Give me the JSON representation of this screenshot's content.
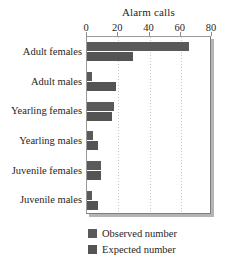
{
  "chart_data": {
    "type": "bar",
    "title": "Alarm calls",
    "xlabel": "Alarm calls",
    "ylabel": "",
    "orientation": "horizontal",
    "xlim": [
      0,
      80
    ],
    "xticks": [
      0,
      20,
      40,
      60,
      80
    ],
    "xtick_labels": [
      "0",
      "20",
      "40",
      "60",
      "80"
    ],
    "grid": "vertical-dotted",
    "axis_position": "top",
    "legend_position": "below-plot",
    "categories": [
      "Adult females",
      "Adult males",
      "Yearling females",
      "Yearling males",
      "Juvenile females",
      "Juvenile males"
    ],
    "series": [
      {
        "name": "Observed number",
        "color": "#5a5a5a",
        "values": [
          65,
          3,
          17,
          4,
          9,
          3
        ]
      },
      {
        "name": "Expected number",
        "color": "#545454",
        "values": [
          29.5,
          18.5,
          16,
          7,
          9,
          7
        ]
      }
    ]
  },
  "legend": {
    "items": [
      {
        "label": "Observed number",
        "color": "#5a5a5a"
      },
      {
        "label": "Expected number",
        "color": "#545454"
      }
    ]
  }
}
